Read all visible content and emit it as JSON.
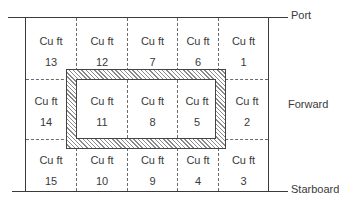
{
  "diagram": {
    "labels": {
      "port": "Port",
      "forward": "Forward",
      "starboard": "Starboard"
    },
    "unit_label": "Cu ft",
    "rows": [
      [
        "13",
        "12",
        "7",
        "6",
        "1"
      ],
      [
        "14",
        "11",
        "8",
        "5",
        "2"
      ],
      [
        "15",
        "10",
        "9",
        "4",
        "3"
      ]
    ],
    "highlight": {
      "description": "Hatched rectangular frame enclosing compartments 11, 8 and 5",
      "enclosed": [
        "11",
        "8",
        "5"
      ]
    }
  }
}
